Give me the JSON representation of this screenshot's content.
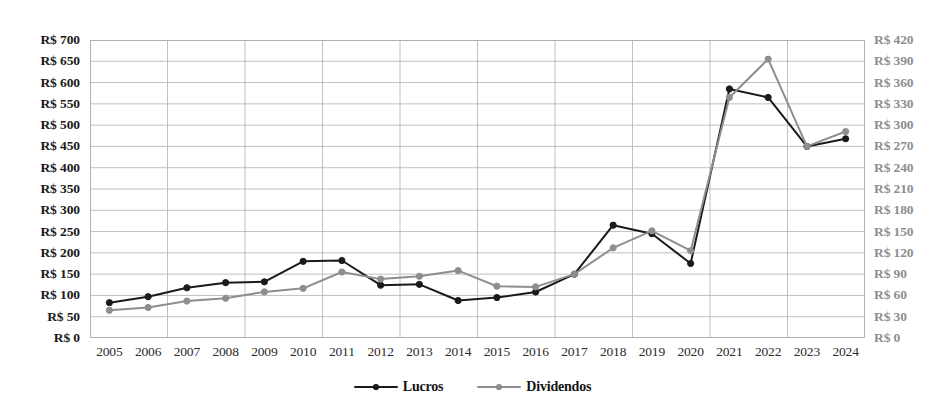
{
  "chart_data": {
    "type": "line",
    "title": "",
    "subtitle": "",
    "xlabel": "",
    "ylabel": "",
    "grid": true,
    "legend_position": "bottom",
    "categories": [
      "2005",
      "2006",
      "2007",
      "2008",
      "2009",
      "2010",
      "2011",
      "2012",
      "2013",
      "2014",
      "2015",
      "2016",
      "2017",
      "2018",
      "2019",
      "2020",
      "2021",
      "2022",
      "2023",
      "2024"
    ],
    "axes": {
      "left": {
        "label_prefix": "R$ ",
        "ylim": [
          0,
          700
        ],
        "step": 50,
        "ticks": [
          0,
          50,
          100,
          150,
          200,
          250,
          300,
          350,
          400,
          450,
          500,
          550,
          600,
          650,
          700
        ],
        "tick_labels": [
          "R$ 0",
          "R$ 50",
          "R$ 100",
          "R$ 150",
          "R$ 200",
          "R$ 250",
          "R$ 300",
          "R$ 350",
          "R$ 400",
          "R$ 450",
          "R$ 500",
          "R$ 550",
          "R$ 600",
          "R$ 650",
          "R$ 700"
        ],
        "series": "Lucros",
        "color": "#1a1a1a"
      },
      "right": {
        "label_prefix": "R$ ",
        "ylim": [
          0,
          420
        ],
        "step": 30,
        "ticks": [
          0,
          30,
          60,
          90,
          120,
          150,
          180,
          210,
          240,
          270,
          300,
          330,
          360,
          390,
          420
        ],
        "tick_labels": [
          "R$ 0",
          "R$ 30",
          "R$ 60",
          "R$ 90",
          "R$ 120",
          "R$ 150",
          "R$ 180",
          "R$ 210",
          "R$ 240",
          "R$ 270",
          "R$ 300",
          "R$ 330",
          "R$ 360",
          "R$ 390",
          "R$ 420"
        ],
        "series": "Dividendos",
        "color": "#8e8e8e"
      }
    },
    "series": [
      {
        "name": "Lucros",
        "axis": "left",
        "color": "#1a1a1a",
        "marker": "circle",
        "values": [
          83,
          97,
          118,
          130,
          132,
          180,
          182,
          124,
          126,
          88,
          95,
          108,
          150,
          265,
          245,
          175,
          585,
          565,
          450,
          468
        ]
      },
      {
        "name": "Dividendos",
        "axis": "right",
        "color": "#8e8e8e",
        "marker": "circle",
        "values": [
          39,
          43,
          52,
          56,
          65,
          70,
          93,
          83,
          87,
          95,
          73,
          72,
          90,
          127,
          151,
          123,
          339,
          393,
          270,
          291
        ]
      }
    ]
  },
  "legend": {
    "items": [
      {
        "label": "Lucros",
        "color": "#1a1a1a"
      },
      {
        "label": "Dividendos",
        "color": "#8e8e8e"
      }
    ]
  }
}
